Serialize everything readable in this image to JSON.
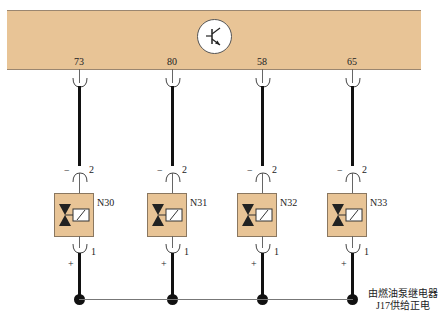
{
  "control_unit": {
    "icon": "transistor-icon",
    "band_color": "#e8c496"
  },
  "channels": [
    {
      "pin": "73",
      "component": "N30",
      "pin_top": "2",
      "pin_bottom": "1",
      "minus": "−",
      "plus": "+"
    },
    {
      "pin": "80",
      "component": "N31",
      "pin_top": "2",
      "pin_bottom": "1",
      "minus": "−",
      "plus": "+"
    },
    {
      "pin": "58",
      "component": "N32",
      "pin_top": "2",
      "pin_bottom": "1",
      "minus": "−",
      "plus": "+"
    },
    {
      "pin": "65",
      "component": "N33",
      "pin_top": "2",
      "pin_bottom": "1",
      "minus": "−",
      "plus": "+"
    }
  ],
  "supply_note": {
    "line1": "由燃油泵继电器",
    "line2": "J17供给正电"
  }
}
